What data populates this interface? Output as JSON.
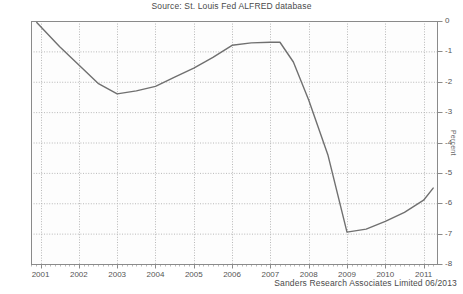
{
  "chart_data": {
    "type": "line",
    "title": "Source: St. Louis Fed ALFRED database",
    "footer": "Sanders Research Associates Limited 06/2013",
    "xlabel": "",
    "ylabel": "Percent",
    "xlim": [
      2000.75,
      2011.35
    ],
    "ylim": [
      -8,
      0
    ],
    "grid": true,
    "legend": "none",
    "line_color": "#707070",
    "grid_color": "#b8b8b8",
    "axis_color": "#8a8a8a",
    "xtick_labels": [
      "2001",
      "2002",
      "2003",
      "2004",
      "2005",
      "2006",
      "2007",
      "2008",
      "2009",
      "2010",
      "2011"
    ],
    "xtick_values": [
      2001,
      2002,
      2003,
      2004,
      2005,
      2006,
      2007,
      2008,
      2009,
      2010,
      2011
    ],
    "ytick_labels": [
      "0",
      "-1",
      "-2",
      "-3",
      "-4",
      "-5",
      "-6",
      "-7",
      "-8"
    ],
    "ytick_values": [
      0,
      -1,
      -2,
      -3,
      -4,
      -5,
      -6,
      -7,
      -8
    ],
    "x": [
      2000.9,
      2001.5,
      2002.0,
      2002.5,
      2003.0,
      2003.5,
      2004.0,
      2004.5,
      2005.0,
      2005.5,
      2006.0,
      2006.5,
      2007.0,
      2007.25,
      2007.6,
      2008.0,
      2008.5,
      2009.0,
      2009.5,
      2010.0,
      2010.5,
      2011.0,
      2011.25
    ],
    "y": [
      -0.05,
      -0.85,
      -1.45,
      -2.05,
      -2.4,
      -2.3,
      -2.15,
      -1.85,
      -1.55,
      -1.2,
      -0.8,
      -0.72,
      -0.7,
      -0.7,
      -1.35,
      -2.6,
      -4.4,
      -6.95,
      -6.85,
      -6.6,
      -6.3,
      -5.9,
      -5.5
    ],
    "series": [
      {
        "name": "Federal deficit (percent)",
        "values": [
          -0.05,
          -0.85,
          -1.45,
          -2.05,
          -2.4,
          -2.3,
          -2.15,
          -1.85,
          -1.55,
          -1.2,
          -0.8,
          -0.72,
          -0.7,
          -0.7,
          -1.35,
          -2.6,
          -4.4,
          -6.95,
          -6.85,
          -6.6,
          -6.3,
          -5.9,
          -5.5
        ]
      }
    ]
  }
}
